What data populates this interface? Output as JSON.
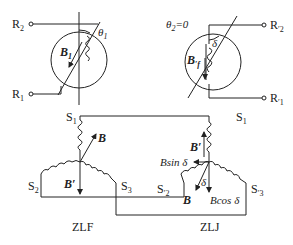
{
  "diagram": {
    "type": "synchro-pair-schematic",
    "left_unit": {
      "name": "ZLF",
      "rotor_terminals": [
        "R2",
        "R1"
      ],
      "rotor_field": "B1",
      "angle_label": "θ1",
      "stator_terminals": [
        "S1",
        "S2",
        "S3"
      ],
      "vectors": [
        "B",
        "B'"
      ]
    },
    "right_unit": {
      "name": "ZLJ",
      "rotor_terminals": [
        "R'2",
        "R'1"
      ],
      "rotor_field": "B'f",
      "angle_label": "θ2=0",
      "delta_label": "δ",
      "stator_terminals": [
        "S1",
        "S'2",
        "S'3"
      ],
      "vectors": [
        "B'",
        "B",
        "Bsin δ",
        "Bcos δ",
        "δ"
      ]
    },
    "labels": {
      "R2": "R",
      "R2_sub": "2",
      "R1": "R",
      "R1_sub": "1",
      "R2p": "R",
      "R2p_sub": "′2",
      "R1p": "R",
      "R1p_sub": "′1",
      "theta1": "θ",
      "theta1_sub": "1",
      "theta2": "θ",
      "theta2_sub": "2",
      "theta2_eq": "=0",
      "B1": "B",
      "B1_sub": "1",
      "Bfp": "B",
      "Bfp_sub": "′f",
      "delta": "δ",
      "S1_left": "S",
      "S1_left_sub": "1",
      "S2_left": "S",
      "S2_left_sub": "2",
      "S3_left": "S",
      "S3_left_sub": "3",
      "S1_right": "S",
      "S1_right_sub": "1",
      "S2_right": "S",
      "S2_right_sub": "′2",
      "S3_right": "S",
      "S3_right_sub": "′3",
      "B_left": "B",
      "Bp_left": "B′",
      "Bp_right": "B′",
      "B_right": "B",
      "Bsin": "Bsin δ",
      "Bcos": "Bcos δ",
      "delta_small": "δ",
      "ZLF": "ZLF",
      "ZLJ": "ZLJ"
    }
  }
}
